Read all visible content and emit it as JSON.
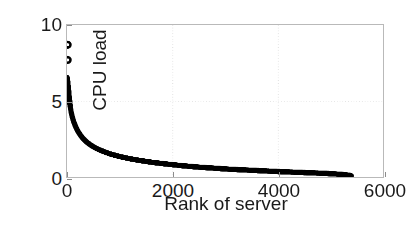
{
  "chart_data": {
    "type": "scatter",
    "title": "",
    "xlabel": "Rank of server",
    "ylabel": "CPU load",
    "xlim": [
      0,
      6000
    ],
    "ylim": [
      0,
      10
    ],
    "xticks": [
      0,
      2000,
      4000,
      6000
    ],
    "xtick_labels": [
      "0",
      "2000",
      "4000",
      "6000"
    ],
    "yticks": [
      0,
      5,
      10
    ],
    "ytick_labels": [
      "0",
      "5",
      "10"
    ],
    "grid": true,
    "grid_style": "dotted",
    "grid_x": [
      2000,
      4000
    ],
    "grid_y": [
      5
    ],
    "legend": null,
    "legend_position": "none",
    "marker": "filled-circle",
    "marker_color": "#000000",
    "marker_size": 5,
    "n_points": 5400,
    "series": [
      {
        "name": "CPU load by rank",
        "x": [
          1,
          2,
          3,
          4,
          5,
          6,
          8,
          10,
          13,
          16,
          20,
          25,
          30,
          40,
          50,
          65,
          80,
          100,
          130,
          160,
          200,
          250,
          300,
          380,
          460,
          560,
          680,
          820,
          1000,
          1200,
          1400,
          1650,
          1900,
          2200,
          2500,
          2800,
          3100,
          3400,
          3700,
          4000,
          4300,
          4600,
          4900,
          5100,
          5250,
          5350,
          5400
        ],
        "y": [
          6.55,
          6.5,
          6.48,
          6.45,
          6.42,
          6.4,
          6.35,
          6.3,
          6.22,
          6.12,
          6.0,
          5.82,
          5.62,
          5.25,
          4.95,
          4.55,
          4.25,
          3.95,
          3.6,
          3.35,
          3.05,
          2.78,
          2.55,
          2.28,
          2.08,
          1.88,
          1.7,
          1.52,
          1.35,
          1.2,
          1.08,
          0.95,
          0.85,
          0.74,
          0.65,
          0.58,
          0.51,
          0.46,
          0.41,
          0.36,
          0.32,
          0.28,
          0.24,
          0.2,
          0.16,
          0.12,
          0.08
        ]
      }
    ],
    "outliers": {
      "name": "High-load outliers",
      "marker": "open-circle",
      "points": [
        {
          "x": 12,
          "y": 8.7
        },
        {
          "x": 12,
          "y": 7.7
        }
      ]
    }
  }
}
